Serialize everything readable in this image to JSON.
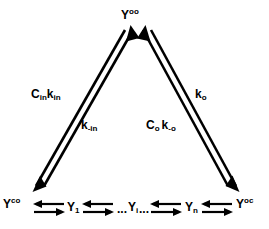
{
  "diagram": {
    "type": "kinetic-reaction-scheme",
    "shape": "triangle-with-linear-chain",
    "stroke_color": "#000000",
    "background_color": "#ffffff",
    "nodes": [
      {
        "id": "Y-oo",
        "base": "Y",
        "superscript": "oo",
        "subscript": "",
        "position": "apex"
      },
      {
        "id": "Y-co",
        "base": "Y",
        "superscript": "co",
        "subscript": "",
        "position": "bottom-left"
      },
      {
        "id": "Y-oc",
        "base": "Y",
        "superscript": "oc",
        "subscript": "",
        "position": "bottom-right"
      },
      {
        "id": "Y-1",
        "base": "Y",
        "superscript": "",
        "subscript": "1",
        "position": "chain-1"
      },
      {
        "id": "Y-i",
        "base": "Y",
        "superscript": "",
        "subscript": "i",
        "position": "chain-middle"
      },
      {
        "id": "Y-n",
        "base": "Y",
        "superscript": "",
        "subscript": "n",
        "position": "chain-n"
      }
    ],
    "ellipsis_left": "...",
    "ellipsis_right": "...",
    "rate_labels": [
      {
        "id": "c-in-k-in",
        "parts": [
          {
            "base": "C",
            "sub": "in"
          },
          {
            "base": "k",
            "sub": "in"
          }
        ],
        "edge": "left-diagonal",
        "side": "outer"
      },
      {
        "id": "k-minus-in",
        "parts": [
          {
            "base": "k",
            "sub": "-in"
          }
        ],
        "edge": "left-diagonal",
        "side": "inner"
      },
      {
        "id": "k-o",
        "parts": [
          {
            "base": "k",
            "sub": "o"
          }
        ],
        "edge": "right-diagonal",
        "side": "outer"
      },
      {
        "id": "c-o-k-minus-o",
        "parts": [
          {
            "base": "C",
            "sub": "o"
          },
          {
            "base": "k",
            "sub": "-o"
          }
        ],
        "edge": "right-diagonal",
        "side": "inner"
      }
    ],
    "edges": [
      {
        "id": "left-diagonal",
        "from": "Y-co",
        "to": "Y-oo",
        "style": "double-line-bidirectional"
      },
      {
        "id": "right-diagonal",
        "from": "Y-oc",
        "to": "Y-oo",
        "style": "double-line-bidirectional"
      },
      {
        "id": "chain-1",
        "from": "Y-co",
        "to": "Y-1",
        "style": "reversible-harpoon-pair"
      },
      {
        "id": "chain-2",
        "from": "Y-1",
        "to": "Y-i",
        "style": "reversible-harpoon-pair"
      },
      {
        "id": "chain-3",
        "from": "Y-i",
        "to": "Y-n",
        "style": "reversible-harpoon-pair"
      },
      {
        "id": "chain-4",
        "from": "Y-n",
        "to": "Y-oc",
        "style": "reversible-harpoon-pair"
      }
    ]
  },
  "labels": {
    "apex": {
      "base": "Y",
      "sup": "oo"
    },
    "bottom_left": {
      "base": "Y",
      "sup": "co"
    },
    "bottom_right": {
      "base": "Y",
      "sup": "oc"
    },
    "chain_1": {
      "base": "Y",
      "sub": "1"
    },
    "chain_i": {
      "base": "Y",
      "sub": "i"
    },
    "chain_n": {
      "base": "Y",
      "sub": "n"
    },
    "dots_before_i": "...",
    "dots_after_i": "...",
    "c_in": {
      "base": "C",
      "sub": "in"
    },
    "k_in": {
      "base": "k",
      "sub": "in"
    },
    "k_minus_in": {
      "base": "k",
      "sub": "-in"
    },
    "k_o": {
      "base": "k",
      "sub": "o"
    },
    "c_o": {
      "base": "C",
      "sub": "o"
    },
    "k_minus_o": {
      "base": "k",
      "sub": "-o"
    }
  }
}
